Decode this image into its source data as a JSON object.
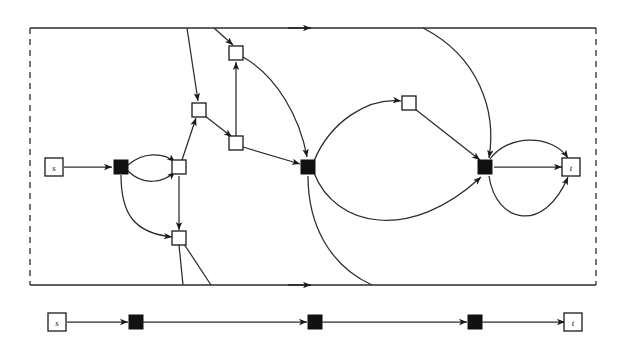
{
  "figure": {
    "colors": {
      "ink": "#1a1a1a",
      "line": "#2b2b2b",
      "node_fill_open": "#ffffff",
      "node_fill_solid": "#111111",
      "background": "#ffffff"
    },
    "border": {
      "style_vertical": "dashed",
      "style_horizontal": "solid",
      "arrow_on_top_edge": true,
      "arrow_on_bottom_edge": true
    }
  },
  "upper_panel": {
    "name": "main-graph",
    "nodes": [
      {
        "id": "s",
        "label": "s",
        "type": "open",
        "x": 54,
        "y": 167
      },
      {
        "id": "a",
        "label": "",
        "type": "solid",
        "x": 121,
        "y": 167
      },
      {
        "id": "b",
        "label": "",
        "type": "open",
        "x": 179,
        "y": 167
      },
      {
        "id": "c",
        "label": "",
        "type": "open",
        "x": 199,
        "y": 110
      },
      {
        "id": "d",
        "label": "",
        "type": "open",
        "x": 236,
        "y": 53
      },
      {
        "id": "e",
        "label": "",
        "type": "open",
        "x": 236,
        "y": 143
      },
      {
        "id": "f",
        "label": "",
        "type": "open",
        "x": 179,
        "y": 238
      },
      {
        "id": "g",
        "label": "",
        "type": "solid",
        "x": 308,
        "y": 167
      },
      {
        "id": "h",
        "label": "",
        "type": "open",
        "x": 409,
        "y": 103
      },
      {
        "id": "i",
        "label": "",
        "type": "solid",
        "x": 485,
        "y": 167
      },
      {
        "id": "t",
        "label": "t",
        "type": "open",
        "x": 570,
        "y": 167
      }
    ],
    "edge_count": 20,
    "node_count": 11
  },
  "lower_panel": {
    "name": "path-chain",
    "nodes": [
      {
        "id": "s2",
        "label": "s",
        "type": "open",
        "x": 57,
        "y": 322
      },
      {
        "id": "p1",
        "label": "",
        "type": "solid",
        "x": 136,
        "y": 322
      },
      {
        "id": "p2",
        "label": "",
        "type": "solid",
        "x": 315,
        "y": 322
      },
      {
        "id": "p3",
        "label": "",
        "type": "solid",
        "x": 475,
        "y": 322
      },
      {
        "id": "t2",
        "label": "t",
        "type": "open",
        "x": 573,
        "y": 322
      }
    ],
    "edge_count": 4,
    "node_count": 5
  }
}
